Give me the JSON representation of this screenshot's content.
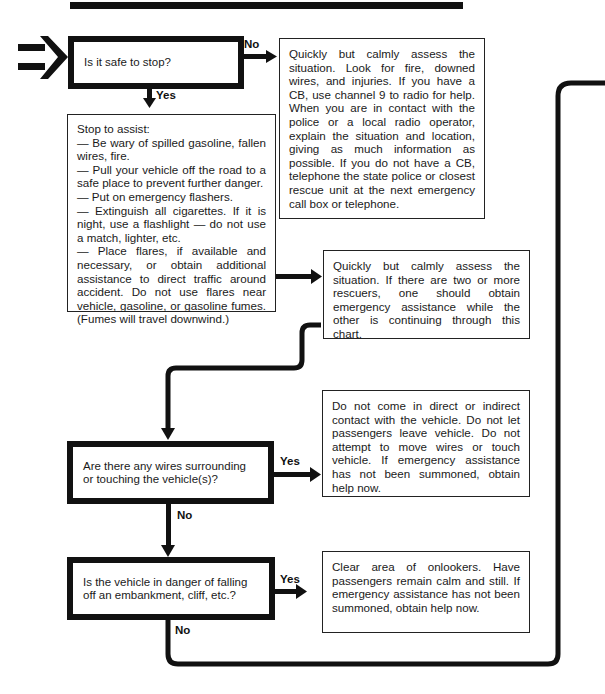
{
  "flowchart": {
    "start": {
      "question": "Is it safe to stop?",
      "no_label": "No",
      "yes_label": "Yes",
      "no_action": "Quickly but calmly assess the situation. Look for fire, downed wires, and injuries. If you have a CB, use channel 9 to radio for help. When you are in contact with the police or a local radio operator, explain the situation and location, giving as much information as possible. If you do not have a CB, telephone the state police or closest rescue unit at the next emergency call box or telephone."
    },
    "stop_to_assist": {
      "heading": "Stop to assist:",
      "items": [
        "— Be wary of spilled gasoline, fallen wires, fire.",
        "— Pull your vehicle off the road to a safe place to prevent further danger.",
        "— Put on emergency flashers.",
        "— Extinguish all cigarettes. If it is night, use a flashlight — do not use a match, lighter, etc.",
        "— Place flares, if available and necessary, or obtain additional assistance to direct traffic around accident. Do not use flares near vehicle, gasoline, or gasoline fumes. (Fumes will travel downwind.)"
      ]
    },
    "assess": {
      "text": "Quickly but calmly assess the situation. If there are two or more rescuers, one should obtain emergency assistance while the other is continuing through this chart."
    },
    "wires": {
      "question": "Are there any wires surrounding or touching the vehicle(s)?",
      "yes_label": "Yes",
      "no_label": "No",
      "yes_action": "Do not come in direct or indirect contact with the vehicle. Do not let passengers leave vehicle. Do not attempt to move wires or touch vehicle. If emergency assistance has not been summoned, obtain help now."
    },
    "falling": {
      "question": "Is the vehicle in danger of falling off an embankment, cliff, etc.?",
      "yes_label": "Yes",
      "no_label": "No",
      "yes_action": "Clear area of onlookers. Have passengers remain calm and still. If emergency assistance has not been summoned, obtain help now."
    }
  },
  "colors": {
    "ink": "#111111",
    "paper": "#ffffff"
  }
}
